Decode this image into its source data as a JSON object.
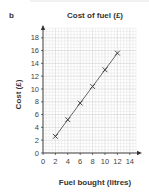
{
  "part_label": "b",
  "chart_data": {
    "type": "line",
    "title": "Cost of fuel (£)",
    "xlabel": "Fuel bought (litres)",
    "ylabel": "Cost (£)",
    "x": [
      2,
      4,
      6,
      8,
      10,
      12
    ],
    "series": [
      {
        "name": "Cost of fuel",
        "values": [
          2.6,
          5.2,
          7.8,
          10.4,
          13.0,
          15.6
        ],
        "marker": "x",
        "line": true
      }
    ],
    "xlim": [
      0,
      15
    ],
    "ylim": [
      0,
      19.5
    ],
    "xticks": [
      0,
      2,
      4,
      6,
      8,
      10,
      12,
      14
    ],
    "yticks": [
      0,
      2,
      4,
      6,
      8,
      10,
      12,
      14,
      16,
      18
    ],
    "grid": true,
    "legend": "none"
  },
  "colors": {
    "grid_minor": "#e2e2e2",
    "grid_major": "#c8c8c8",
    "axis": "#333333",
    "line": "#555555"
  }
}
